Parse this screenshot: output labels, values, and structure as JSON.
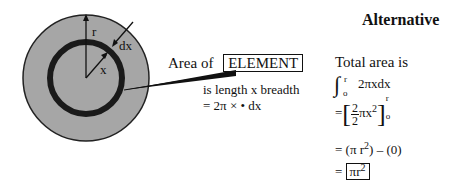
{
  "diagram": {
    "labels": {
      "radius": "r",
      "element_width": "dx",
      "element_radius": "x"
    },
    "colors": {
      "disc_fill": "#a6a6a6",
      "ring_stroke": "#1a1a1a",
      "outline": "#222222"
    }
  },
  "callout": {
    "prefix": "Area of",
    "boxed_word": "ELEMENT",
    "line1": "is length x breadth",
    "line2": "= 2π × • dx"
  },
  "alternative": {
    "title": "Alternative",
    "intro": "Total area is",
    "integral": {
      "symbol": "∫",
      "upper": "r",
      "lower": "o",
      "integrand": "2πxdx"
    },
    "step1": {
      "eq": "=",
      "numerator": "2",
      "denominator": "2",
      "body": "πx",
      "exp": "2",
      "upper": "r",
      "lower": "o"
    },
    "step2": {
      "text": "= (π r",
      "exp": "2",
      "rest": ") – (0)"
    },
    "result": {
      "eq": "=",
      "boxed": "πr",
      "exp": "2"
    }
  }
}
